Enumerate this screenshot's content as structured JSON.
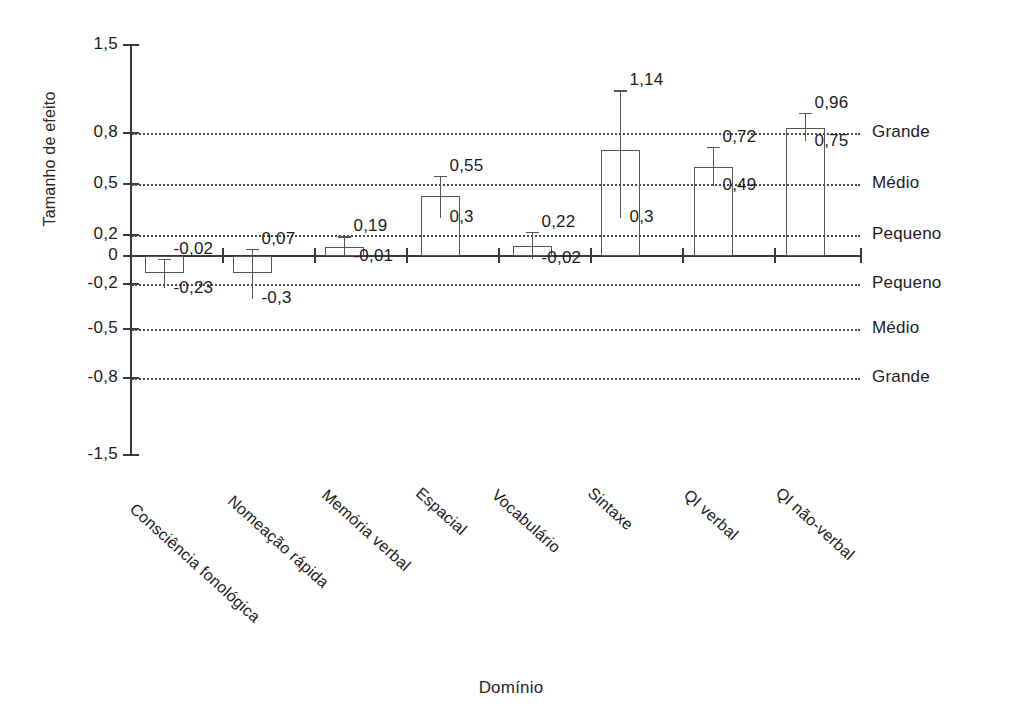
{
  "chart_data": {
    "type": "bar",
    "title": "",
    "xlabel": "Domínio",
    "ylabel": "Tamanho de efeito",
    "ylim": [
      -1.5,
      1.5
    ],
    "grid": true,
    "legend_position": "right-outside-as-axis-annotations",
    "categories": [
      "Consciência fonológica",
      "Nomeação rápida",
      "Memória verbal",
      "Espacial",
      "Vocabulário",
      "Sintaxe",
      "QI verbal",
      "QI não-verbal"
    ],
    "values": [
      -0.12,
      -0.12,
      0.09,
      0.43,
      0.1,
      0.7,
      0.6,
      0.84
    ],
    "ci_upper": [
      -0.02,
      0.07,
      0.19,
      0.55,
      0.22,
      1.14,
      0.72,
      0.96
    ],
    "ci_lower": [
      -0.23,
      -0.3,
      -0.01,
      0.3,
      -0.02,
      0.3,
      0.49,
      0.75
    ],
    "upper_labels": [
      "-0,02",
      "0,07",
      "0,19",
      "0,55",
      "0,22",
      "1,14",
      "0,72",
      "0,96"
    ],
    "lower_labels": [
      "-0,23",
      "-0,3",
      "-0,01",
      "0,3",
      "-0,02",
      "0,3",
      "0,49",
      "0,75"
    ],
    "ytick_labels": [
      "1,5",
      "0,8",
      "0,5",
      "0,2",
      "0",
      "-0,2",
      "-0,5",
      "-0,8",
      "-1,5"
    ],
    "ytick_values": [
      1.5,
      0.8,
      0.5,
      0.2,
      0,
      -0.2,
      -0.5,
      -0.8,
      -1.5
    ],
    "gridline_values": [
      0.8,
      0.5,
      0.2,
      -0.2,
      -0.5,
      -0.8
    ],
    "gridline_labels": [
      "Grande",
      "Médio",
      "Pequeno",
      "Pequeno",
      "Médio",
      "Grande"
    ],
    "series_color": "#555555"
  }
}
